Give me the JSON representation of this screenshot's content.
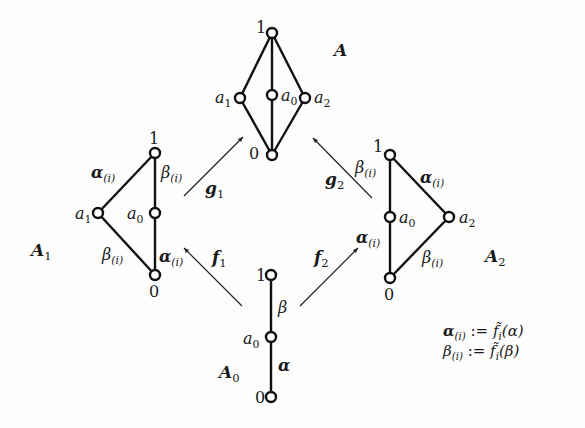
{
  "lattices": {
    "A": {
      "name": "A",
      "nodes": {
        "top": "1",
        "left": "a",
        "left_sub": "1",
        "mid": "a",
        "mid_sub": "0",
        "right": "a",
        "right_sub": "2",
        "bottom": "0"
      }
    },
    "A1": {
      "name": "A",
      "name_sub": "1",
      "nodes": {
        "top": "1",
        "left": "a",
        "left_sub": "1",
        "mid": "a",
        "mid_sub": "0",
        "bottom": "0"
      },
      "edges": {
        "top_left": "α",
        "top_mid": "β",
        "left_bottom": "β",
        "mid_bottom": "α",
        "edge_sub": "(i)"
      }
    },
    "A2": {
      "name": "A",
      "name_sub": "2",
      "nodes": {
        "top": "1",
        "mid": "a",
        "mid_sub": "0",
        "right": "a",
        "right_sub": "2",
        "bottom": "0"
      },
      "edges": {
        "top_mid": "β",
        "top_right": "α",
        "mid_bottom": "α",
        "right_bottom": "β",
        "edge_sub": "(i)"
      }
    },
    "A0": {
      "name": "A",
      "name_sub": "0",
      "nodes": {
        "top": "1",
        "mid": "a",
        "mid_sub": "0",
        "bottom": "0"
      },
      "edges": {
        "upper": "β",
        "lower": "α"
      }
    }
  },
  "maps": {
    "g1": {
      "name": "g",
      "sub": "1"
    },
    "g2": {
      "name": "g",
      "sub": "2"
    },
    "f1": {
      "name": "f",
      "sub": "1"
    },
    "f2": {
      "name": "f",
      "sub": "2"
    }
  },
  "definitions": [
    {
      "lhs": "α",
      "lhs_sub": "(i)",
      "op": ":=",
      "fn": "f̃",
      "fn_sub": "i",
      "arg": "(α)"
    },
    {
      "lhs": "β",
      "lhs_sub": "(i)",
      "op": ":=",
      "fn": "f̃",
      "fn_sub": "i",
      "arg": "(β)"
    }
  ]
}
